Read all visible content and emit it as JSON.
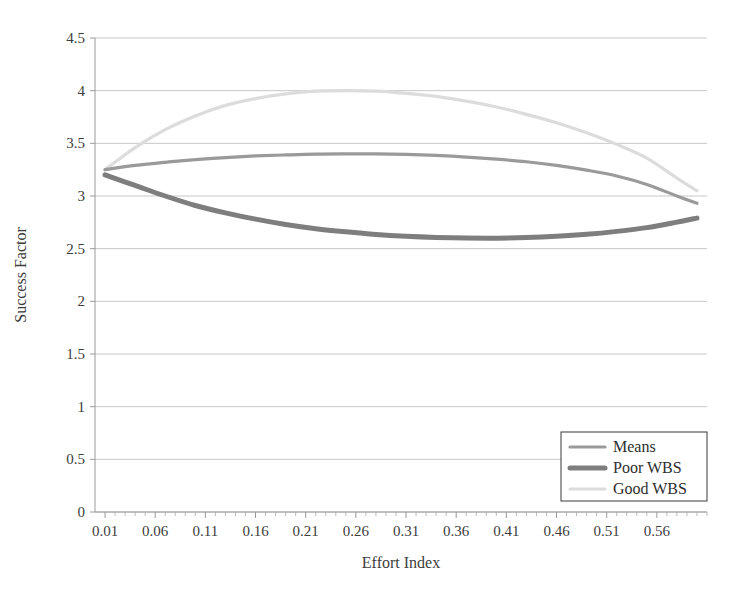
{
  "chart_data": {
    "type": "line",
    "title": "",
    "xlabel": "Effort Index",
    "ylabel": "Success Factor",
    "xlim": [
      0.0,
      0.61
    ],
    "ylim": [
      0,
      4.5
    ],
    "ytick_values": [
      0,
      0.5,
      1,
      1.5,
      2,
      2.5,
      3,
      3.5,
      4,
      4.5
    ],
    "ytick_labels": [
      "0",
      "0.5",
      "1",
      "1.5",
      "2",
      "2.5",
      "3",
      "3.5",
      "4",
      "4.5"
    ],
    "xtick_values": [
      0.01,
      0.06,
      0.11,
      0.16,
      0.21,
      0.26,
      0.31,
      0.36,
      0.41,
      0.46,
      0.51,
      0.56
    ],
    "xtick_labels": [
      "0.01",
      "0.06",
      "0.11",
      "0.16",
      "0.21",
      "0.26",
      "0.31",
      "0.36",
      "0.41",
      "0.46",
      "0.51",
      "0.56"
    ],
    "x_minor_tick_step": 0.01,
    "grid": "horizontal",
    "legend_position": "lower-right",
    "x": [
      0.01,
      0.04,
      0.07,
      0.1,
      0.13,
      0.16,
      0.19,
      0.22,
      0.25,
      0.28,
      0.31,
      0.34,
      0.37,
      0.4,
      0.43,
      0.46,
      0.49,
      0.52,
      0.55,
      0.58,
      0.6
    ],
    "series": [
      {
        "name": "Means",
        "color": "#9a9a9a",
        "width": 3.2,
        "values": [
          3.25,
          3.29,
          3.32,
          3.345,
          3.365,
          3.38,
          3.39,
          3.398,
          3.4,
          3.4,
          3.395,
          3.385,
          3.37,
          3.35,
          3.325,
          3.29,
          3.245,
          3.19,
          3.11,
          3.0,
          2.93
        ]
      },
      {
        "name": "Poor WBS",
        "color": "#7e7e7e",
        "width": 5.0,
        "values": [
          3.2,
          3.1,
          3.0,
          2.91,
          2.84,
          2.78,
          2.73,
          2.69,
          2.66,
          2.635,
          2.618,
          2.607,
          2.601,
          2.6,
          2.605,
          2.617,
          2.636,
          2.664,
          2.7,
          2.752,
          2.79
        ]
      },
      {
        "name": "Good WBS",
        "color": "#dcdcdc",
        "width": 3.2,
        "values": [
          3.25,
          3.46,
          3.63,
          3.76,
          3.86,
          3.925,
          3.97,
          3.995,
          4.0,
          3.995,
          3.975,
          3.945,
          3.9,
          3.845,
          3.775,
          3.695,
          3.6,
          3.49,
          3.36,
          3.17,
          3.05
        ]
      }
    ],
    "legend_entries": [
      {
        "label": "Means",
        "color": "#9a9a9a",
        "width": 3.2
      },
      {
        "label": "Poor WBS",
        "color": "#7e7e7e",
        "width": 5.0
      },
      {
        "label": "Good WBS",
        "color": "#dcdcdc",
        "width": 3.2
      }
    ]
  },
  "plot_geometry": {
    "left": 95,
    "right": 707,
    "top": 38,
    "bottom": 512
  }
}
